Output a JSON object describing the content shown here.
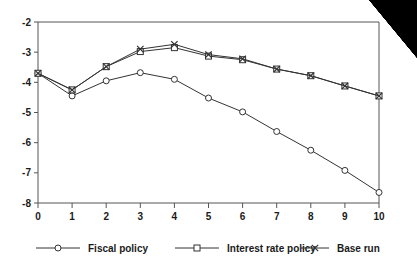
{
  "chart_data": {
    "type": "line",
    "title": "",
    "subtitle": "",
    "xlabel": "",
    "ylabel": "",
    "x": [
      0,
      1,
      2,
      3,
      4,
      5,
      6,
      7,
      8,
      9,
      10
    ],
    "xticklabels": [
      "0",
      "1",
      "2",
      "3",
      "4",
      "5",
      "6",
      "7",
      "8",
      "9",
      "10"
    ],
    "yticklabels": [
      "-2",
      "-3",
      "-4",
      "-5",
      "-6",
      "-7",
      "-8"
    ],
    "yticks": [
      -2,
      -3,
      -4,
      -5,
      -6,
      -7,
      -8
    ],
    "xlim": [
      0,
      10
    ],
    "ylim": [
      -8,
      -2
    ],
    "grid": false,
    "legend_position": "bottom",
    "series": [
      {
        "name": "Fiscal policy",
        "marker": "circle",
        "color": "#333333",
        "values": [
          -3.7,
          -4.45,
          -3.95,
          -3.68,
          -3.9,
          -4.52,
          -4.98,
          -5.63,
          -6.25,
          -6.92,
          -7.65
        ]
      },
      {
        "name": "Interest rate policy",
        "marker": "square",
        "color": "#333333",
        "values": [
          -3.7,
          -4.25,
          -3.48,
          -2.98,
          -2.85,
          -3.13,
          -3.25,
          -3.56,
          -3.78,
          -4.12,
          -4.45
        ]
      },
      {
        "name": "Base run",
        "marker": "x",
        "color": "#333333",
        "values": [
          -3.7,
          -4.25,
          -3.48,
          -2.9,
          -2.74,
          -3.08,
          -3.22,
          -3.56,
          -3.78,
          -4.12,
          -4.45
        ]
      }
    ]
  },
  "legend": {
    "items": [
      {
        "label": "Fiscal policy",
        "marker": "circle-marker-icon"
      },
      {
        "label": "Interest rate policy",
        "marker": "square-marker-icon"
      },
      {
        "label": "Base run",
        "marker": "x-marker-icon"
      }
    ]
  }
}
